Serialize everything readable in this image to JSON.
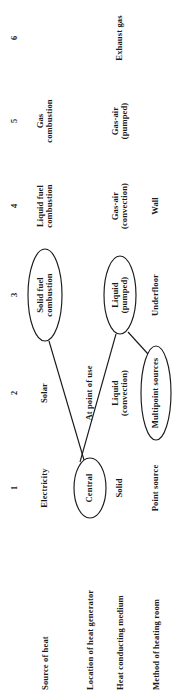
{
  "figure": {
    "kind": "morphological-chart",
    "orientation": "rotated-90-ccw",
    "ink_color": "#1a1a1a",
    "background_color": "#ffffff"
  },
  "columns": {
    "numbers": [
      "1",
      "2",
      "3",
      "4",
      "5",
      "6"
    ]
  },
  "rows": [
    {
      "label": "Source of heat",
      "options": [
        "Electricity",
        "Solar",
        "Solid fuel\ncombustion",
        "Liquid fuel\ncombustion",
        "Gas\ncombustion",
        ""
      ],
      "selected_index": 2
    },
    {
      "label": "Location of heat generator",
      "options": [
        "Central",
        "At point of use",
        "",
        "",
        "",
        ""
      ],
      "selected_index": 0
    },
    {
      "label": "Heat conducting medium",
      "options": [
        "Solid",
        "Liquid\n(convection)",
        "Liquid\n(pumped)",
        "Gas-air\n(convection)",
        "Gas-air\n(pumped)",
        "Exhaust gas"
      ],
      "selected_index": 2
    },
    {
      "label": "Method of heating room",
      "options": [
        "Point source",
        "Multipoint sources",
        "Underfloor",
        "Wall",
        "",
        ""
      ],
      "selected_index": 1
    }
  ],
  "solution_path": {
    "description": "Line linking the circled options: Solid fuel combustion → Central → At point of use → Liquid (pumped) → Multipoint sources",
    "nodes": [
      "Solid fuel combustion",
      "Central",
      "At point of use",
      "Liquid (pumped)",
      "Multipoint sources"
    ]
  }
}
